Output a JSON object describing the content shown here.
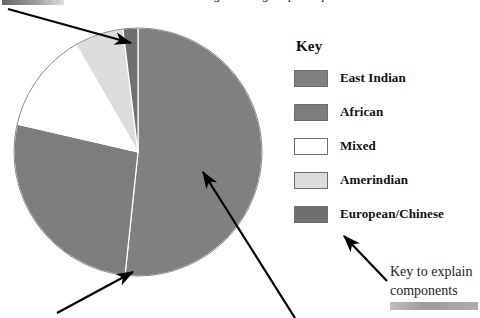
{
  "figure": {
    "title_clipped": "Pie chart showing ethnic group composition",
    "note_line_1": "Key to explain",
    "note_line_2": "components"
  },
  "legend": {
    "heading": "Key",
    "items": [
      {
        "label": "East Indian",
        "color": "#808080",
        "swatch_name": "swatch-east-indian"
      },
      {
        "label": "African",
        "color": "#7d7d7d",
        "swatch_name": "swatch-african"
      },
      {
        "label": "Mixed",
        "color": "#ffffff",
        "swatch_name": "swatch-mixed"
      },
      {
        "label": "Amerindian",
        "color": "#dcdcdc",
        "swatch_name": "swatch-amerindian"
      },
      {
        "label": "European/Chinese",
        "color": "#707070",
        "swatch_name": "swatch-european-chinese"
      }
    ]
  },
  "chart_data": {
    "type": "pie",
    "title": "Pie chart showing ethnic group composition",
    "legend_position": "right",
    "grid": false,
    "start_angle_deg": 0,
    "direction": "clockwise",
    "categories": [
      "East Indian",
      "African",
      "Mixed",
      "Amerindian",
      "European/Chinese"
    ],
    "values": [
      51.7,
      27.0,
      13.0,
      6.4,
      1.9
    ],
    "unit": "percent",
    "colors": [
      "#808080",
      "#7d7d7d",
      "#ffffff",
      "#dcdcdc",
      "#707070"
    ],
    "slice_angles_deg": [
      186.0,
      97.0,
      47.0,
      23.0,
      7.0
    ],
    "annotations": [
      "Key to explain components"
    ]
  },
  "arrows": [
    {
      "name": "arrow-to-small-slices",
      "from_x": 8,
      "from_y": 9,
      "to_x": 131,
      "to_y": 43
    },
    {
      "name": "arrow-to-slice-boundary",
      "from_x": 57,
      "from_y": 313,
      "to_x": 133,
      "to_y": 272
    },
    {
      "name": "arrow-to-largest-slice",
      "from_x": 295,
      "from_y": 318,
      "to_x": 203,
      "to_y": 172
    },
    {
      "name": "arrow-to-key",
      "from_x": 387,
      "from_y": 281,
      "to_x": 344,
      "to_y": 236
    }
  ]
}
